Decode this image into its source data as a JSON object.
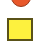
{
  "shapes": {
    "circle": {
      "icon": "circle-shape",
      "fill": "#e8572a",
      "stroke": "#9a3a1c"
    },
    "square": {
      "icon": "square-shape",
      "fill": "#fdf13e",
      "stroke": "#5a5218"
    }
  }
}
